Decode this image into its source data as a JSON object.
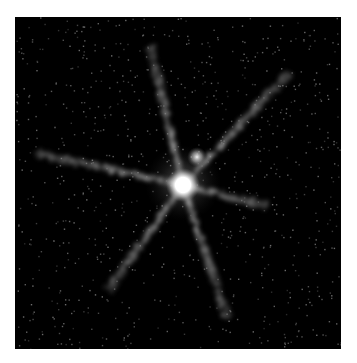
{
  "image": {
    "subject": "star-with-companion",
    "description": "Astronomical image of a bright star with a fainter nearby companion and six diffraction spikes on a black background",
    "background_color": "#000000",
    "border_color": "#ffffff",
    "frame": {
      "x": 15,
      "y": 17,
      "width": 326,
      "height": 332
    },
    "primary_source": {
      "x": 183,
      "y": 185,
      "radius": 11,
      "color": "#ffffff"
    },
    "companion_source": {
      "x": 197,
      "y": 157,
      "radius": 5,
      "color": "#e8e8e8"
    },
    "spikes": [
      {
        "name": "spike-up",
        "x2": 150,
        "y2": 45
      },
      {
        "name": "spike-up-right",
        "x2": 290,
        "y2": 72
      },
      {
        "name": "spike-right",
        "x2": 268,
        "y2": 206
      },
      {
        "name": "spike-down",
        "x2": 228,
        "y2": 320
      },
      {
        "name": "spike-down-left",
        "x2": 108,
        "y2": 290
      },
      {
        "name": "spike-left",
        "x2": 35,
        "y2": 153
      }
    ]
  }
}
